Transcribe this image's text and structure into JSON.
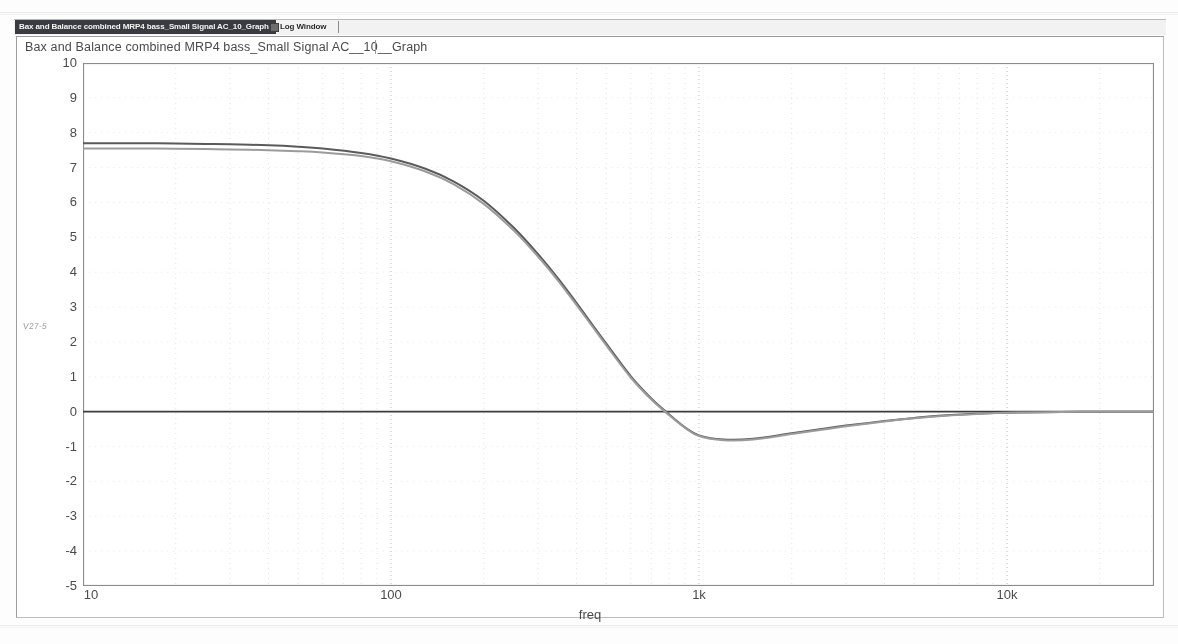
{
  "window": {
    "graph_title": "Bax and Balance combined MRP4 bass_Small Signal AC__10__Graph"
  },
  "tabs": [
    {
      "id": "graph",
      "label": "Bax and Balance combined MRP4 bass_Small Signal AC_10_Graph",
      "selected": true
    },
    {
      "id": "log",
      "label": "Log Window",
      "selected": false
    }
  ],
  "plot": {
    "side_note": "V27-5"
  },
  "chart_data": {
    "type": "line",
    "title": "Bax and Balance combined MRP4 bass_Small Signal AC__10__Graph",
    "xlabel": "freq",
    "ylabel": "",
    "xscale": "log",
    "xlim": [
      10,
      30000
    ],
    "ylim": [
      -5,
      10
    ],
    "grid": true,
    "grid_minor": true,
    "legend": "none",
    "y_ticks": [
      "10",
      "9",
      "8",
      "7",
      "6",
      "5",
      "4",
      "3",
      "2",
      "1",
      "0",
      "-1",
      "-2",
      "-3",
      "-4",
      "-5"
    ],
    "y_tick_values": [
      10,
      9,
      8,
      7,
      6,
      5,
      4,
      3,
      2,
      1,
      0,
      -1,
      -2,
      -3,
      -4,
      -5
    ],
    "x_ticks": [
      "10",
      "100",
      "1k",
      "10k"
    ],
    "x_tick_values": [
      10,
      100,
      1000,
      10000
    ],
    "zero_line": 0,
    "series": [
      {
        "name": "trace-1",
        "color": "#5a5a5a",
        "x": [
          10,
          12,
          15,
          20,
          25,
          30,
          40,
          50,
          60,
          80,
          100,
          130,
          160,
          200,
          250,
          300,
          350,
          400,
          450,
          500,
          600,
          700,
          800,
          900,
          1000,
          1200,
          1500,
          2000,
          2500,
          3000,
          4000,
          5000,
          6000,
          8000,
          10000,
          15000,
          20000,
          30000
        ],
        "y": [
          7.7,
          7.7,
          7.7,
          7.69,
          7.68,
          7.67,
          7.64,
          7.6,
          7.55,
          7.42,
          7.26,
          6.96,
          6.6,
          6.05,
          5.28,
          4.52,
          3.8,
          3.12,
          2.5,
          1.95,
          1.02,
          0.38,
          -0.08,
          -0.45,
          -0.68,
          -0.8,
          -0.78,
          -0.62,
          -0.5,
          -0.4,
          -0.27,
          -0.18,
          -0.12,
          -0.06,
          -0.03,
          -0.01,
          0.0,
          0.0
        ]
      },
      {
        "name": "trace-2",
        "color": "#9b9b9b",
        "x": [
          10,
          12,
          15,
          20,
          25,
          30,
          40,
          50,
          60,
          80,
          100,
          130,
          160,
          200,
          250,
          300,
          350,
          400,
          450,
          500,
          600,
          700,
          800,
          900,
          1000,
          1200,
          1500,
          2000,
          2500,
          3000,
          4000,
          5000,
          6000,
          8000,
          10000,
          15000,
          20000,
          30000
        ],
        "y": [
          7.55,
          7.55,
          7.55,
          7.54,
          7.53,
          7.52,
          7.5,
          7.47,
          7.43,
          7.33,
          7.18,
          6.88,
          6.52,
          5.96,
          5.2,
          4.45,
          3.74,
          3.06,
          2.45,
          1.9,
          0.98,
          0.35,
          -0.1,
          -0.46,
          -0.7,
          -0.82,
          -0.8,
          -0.64,
          -0.52,
          -0.42,
          -0.28,
          -0.19,
          -0.13,
          -0.07,
          -0.03,
          -0.01,
          0.0,
          0.0
        ]
      }
    ]
  }
}
